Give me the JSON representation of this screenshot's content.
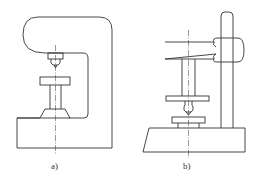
{
  "figures": [
    {
      "id": "a",
      "label": "a)",
      "description": "C-frame measuring stand with anvil table and indicator tip"
    },
    {
      "id": "b",
      "label": "b)",
      "description": "Column-type measuring stand with swing arm, spindle and worktable"
    }
  ],
  "colors": {
    "line": "#333333",
    "background": "#ffffff"
  }
}
